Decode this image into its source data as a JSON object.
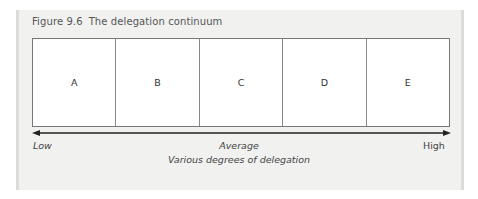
{
  "figure": {
    "number": "Figure 9.6",
    "title": "The delegation continuum"
  },
  "diagram": {
    "cells": [
      "A",
      "B",
      "C",
      "D",
      "E"
    ],
    "arrow": {
      "direction": "bidirectional"
    },
    "scale_labels": {
      "left": "Low",
      "center": "Average",
      "right": "High"
    },
    "axis_label": "Various degrees of delegation"
  },
  "colors": {
    "panel_background": "#f1f1f0",
    "panel_border": "#dcdcdb",
    "box_border": "#777777",
    "arrow": "#222222"
  }
}
